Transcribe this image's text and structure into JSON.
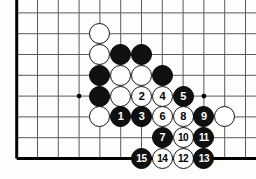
{
  "figure": {
    "width": 256,
    "height": 179,
    "background_color": "#fdfdfc"
  },
  "board": {
    "line_color": "#5a5a5a",
    "edge_color": "#000000",
    "star_point_color": "#000000",
    "origin_x": 16.7,
    "origin_y": 12.9,
    "spacing": 20.8,
    "columns": 12,
    "rows": 8,
    "edges": [
      "left",
      "bottom"
    ],
    "star_points": [
      {
        "col": 3,
        "row": 4
      },
      {
        "col": 9,
        "row": 4
      }
    ]
  },
  "stones": [
    {
      "id": "w-a",
      "color": "white",
      "label": "",
      "col": 4,
      "row": 1
    },
    {
      "id": "w-b",
      "color": "white",
      "label": "",
      "col": 4,
      "row": 2
    },
    {
      "id": "b-a",
      "color": "black",
      "label": "",
      "col": 5,
      "row": 2
    },
    {
      "id": "b-b",
      "color": "black",
      "label": "",
      "col": 6,
      "row": 2
    },
    {
      "id": "b-c",
      "color": "black",
      "label": "",
      "col": 4,
      "row": 3
    },
    {
      "id": "w-c",
      "color": "white",
      "label": "",
      "col": 5,
      "row": 3
    },
    {
      "id": "w-d",
      "color": "white",
      "label": "",
      "col": 6,
      "row": 3
    },
    {
      "id": "b-d",
      "color": "black",
      "label": "",
      "col": 7,
      "row": 3
    },
    {
      "id": "b-e",
      "color": "black",
      "label": "",
      "col": 4,
      "row": 4
    },
    {
      "id": "w-e",
      "color": "white",
      "label": "",
      "col": 5,
      "row": 4
    },
    {
      "id": "m2",
      "color": "white",
      "label": "2",
      "col": 6,
      "row": 4
    },
    {
      "id": "m4",
      "color": "white",
      "label": "4",
      "col": 7,
      "row": 4
    },
    {
      "id": "m5",
      "color": "black",
      "label": "5",
      "col": 8,
      "row": 4
    },
    {
      "id": "w-f",
      "color": "white",
      "label": "",
      "col": 4,
      "row": 5
    },
    {
      "id": "m1",
      "color": "black",
      "label": "1",
      "col": 5,
      "row": 5
    },
    {
      "id": "m3",
      "color": "black",
      "label": "3",
      "col": 6,
      "row": 5
    },
    {
      "id": "m6",
      "color": "white",
      "label": "6",
      "col": 7,
      "row": 5
    },
    {
      "id": "m8",
      "color": "white",
      "label": "8",
      "col": 8,
      "row": 5
    },
    {
      "id": "m9",
      "color": "black",
      "label": "9",
      "col": 9,
      "row": 5
    },
    {
      "id": "w-g",
      "color": "white",
      "label": "",
      "col": 10,
      "row": 5
    },
    {
      "id": "m7",
      "color": "black",
      "label": "7",
      "col": 7,
      "row": 6
    },
    {
      "id": "m10",
      "color": "white",
      "label": "10",
      "col": 8,
      "row": 6
    },
    {
      "id": "m11",
      "color": "black",
      "label": "11",
      "col": 9,
      "row": 6
    },
    {
      "id": "m15",
      "color": "black",
      "label": "15",
      "col": 6,
      "row": 7
    },
    {
      "id": "m14",
      "color": "white",
      "label": "14",
      "col": 7,
      "row": 7
    },
    {
      "id": "m12",
      "color": "white",
      "label": "12",
      "col": 8,
      "row": 7
    },
    {
      "id": "m13",
      "color": "black",
      "label": "13",
      "col": 9,
      "row": 7
    }
  ]
}
